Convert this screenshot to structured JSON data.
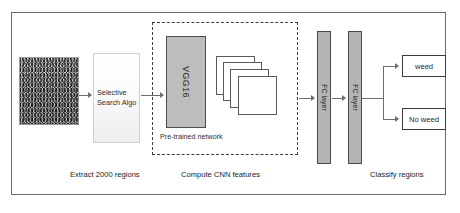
{
  "diagram": {
    "frame": {
      "name": "outer-frame"
    },
    "input_image": {
      "label": "input-image-patch",
      "description": "grayscale grass texture"
    },
    "selective_search": {
      "label": "Selective\nSearch Algo",
      "line1": "Selective",
      "line2": "Search Algo"
    },
    "pretrained_region": {
      "label": "Pre-trained network"
    },
    "vgg": {
      "label": "VGG16"
    },
    "feature_maps": {
      "count": 4,
      "label": "feature-maps"
    },
    "fc_layers": [
      {
        "label": "FC layer"
      },
      {
        "label": "FC layer"
      }
    ],
    "outputs": [
      {
        "label": "weed"
      },
      {
        "label": "No weed"
      }
    ],
    "captions": [
      {
        "text": "Extract 2000 regions"
      },
      {
        "text": "Compute CNN features"
      },
      {
        "text": "Classify regions"
      }
    ],
    "colors": {
      "frame_border": "#6a6a6a",
      "dashed_border": "#3c3c3c",
      "block_fill": "#bdbdbd",
      "fc_fill": "#b4b4b4",
      "arrow": "#6e6e6e",
      "text": "#232323",
      "background": "#ffffff"
    }
  }
}
